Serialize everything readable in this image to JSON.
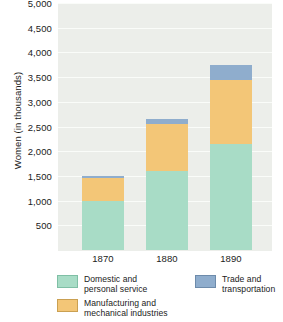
{
  "chart_data": {
    "type": "bar",
    "subtype": "stacked-bar",
    "title": "",
    "xlabel": "",
    "ylabel": "Women (in thousands)",
    "categories": [
      "1870",
      "1880",
      "1890"
    ],
    "ylim": [
      0,
      5000
    ],
    "ytick_values": [
      500,
      1000,
      1500,
      2000,
      2500,
      3000,
      3500,
      4000,
      4500,
      5000
    ],
    "ytick_labels": [
      "500",
      "1,000",
      "1,500",
      "2,000",
      "2,500",
      "3,000",
      "3,500",
      "4,000",
      "4,500",
      "5,000"
    ],
    "grid": true,
    "legend_position": "bottom",
    "series": [
      {
        "name": "Domestic and\npersonal service",
        "color": "#a8dcc6",
        "values": [
          1000,
          1600,
          2150
        ]
      },
      {
        "name": "Manufacturing and\nmechanical industries",
        "color": "#f3c677",
        "values": [
          450,
          950,
          1300
        ]
      },
      {
        "name": "Trade and\ntransportation",
        "color": "#8fadcd",
        "values": [
          50,
          100,
          300
        ]
      }
    ],
    "totals": [
      1500,
      2650,
      3750
    ]
  },
  "axis": {
    "y_title": "Women (in thousands)",
    "y_ticks": [
      {
        "label": "5,000",
        "value": 5000
      },
      {
        "label": "4,500",
        "value": 4500
      },
      {
        "label": "4,000",
        "value": 4000
      },
      {
        "label": "3,500",
        "value": 3500
      },
      {
        "label": "3,000",
        "value": 3000
      },
      {
        "label": "2,500",
        "value": 2500
      },
      {
        "label": "2,000",
        "value": 2000
      },
      {
        "label": "1,500",
        "value": 1500
      },
      {
        "label": "1,000",
        "value": 1000
      },
      {
        "label": "500",
        "value": 500
      }
    ],
    "x_labels": [
      "1870",
      "1880",
      "1890"
    ]
  },
  "legend": {
    "items": [
      {
        "label": "Domestic and\npersonal service",
        "color": "#a8dcc6"
      },
      {
        "label": "Manufacturing and\nmechanical industries",
        "color": "#f3c677"
      },
      {
        "label": "Trade and\ntransportation",
        "color": "#8fadcd"
      }
    ]
  }
}
